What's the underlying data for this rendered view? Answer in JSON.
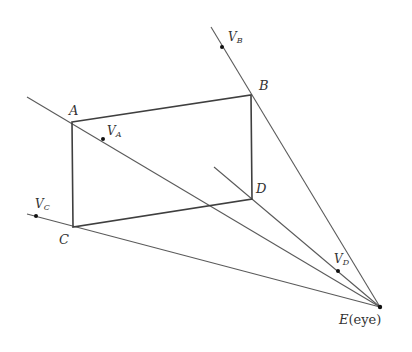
{
  "diagram": {
    "colors": {
      "line": "#555555",
      "rect": "#444444",
      "dot": "#111111",
      "text": "#333333"
    },
    "points": {
      "A": {
        "x": 72,
        "y": 122
      },
      "B": {
        "x": 251,
        "y": 95
      },
      "C": {
        "x": 73,
        "y": 227
      },
      "D": {
        "x": 252,
        "y": 199
      },
      "E": {
        "x": 380,
        "y": 307
      }
    },
    "ray_ends": {
      "A": {
        "x": 27,
        "y": 97
      },
      "B": {
        "x": 211,
        "y": 27
      },
      "C": {
        "x": 27,
        "y": 214
      },
      "D": {
        "x": 214,
        "y": 167
      }
    },
    "vanishing_points": {
      "VA": {
        "x": 103,
        "y": 139
      },
      "VB": {
        "x": 222,
        "y": 47
      },
      "VC": {
        "x": 36,
        "y": 216
      },
      "VD": {
        "x": 338,
        "y": 271
      }
    },
    "labels": {
      "A": "A",
      "B": "B",
      "C": "C",
      "D": "D",
      "E": "E",
      "E_suffix": "(eye)",
      "V": "V",
      "VA_sub": "A",
      "VB_sub": "B",
      "VC_sub": "C",
      "VD_sub": "D"
    }
  }
}
